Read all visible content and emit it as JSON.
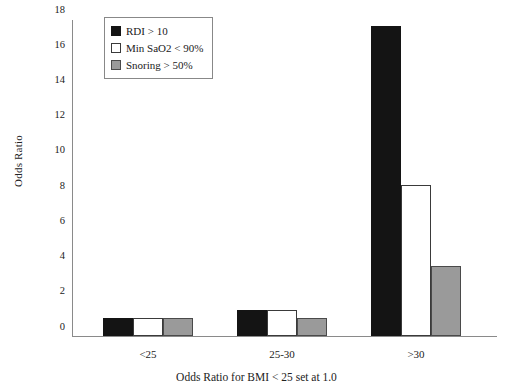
{
  "chart_data": {
    "type": "bar",
    "title": "",
    "xlabel": "Odds Ratio for BMI < 25 set at 1.0",
    "ylabel": "Odds Ratio",
    "categories": [
      "<25",
      "25-30",
      ">30"
    ],
    "series": [
      {
        "name": "RDI > 10",
        "color": "#141414",
        "values": [
          1.0,
          1.5,
          17.6
        ]
      },
      {
        "name": "Min SaO2 < 90%",
        "color": "#ffffff",
        "values": [
          1.0,
          1.5,
          8.6
        ]
      },
      {
        "name": "Snoring > 50%",
        "color": "#9a9a9a",
        "values": [
          1.0,
          1.0,
          4.0
        ]
      }
    ],
    "ylim": [
      0,
      18
    ],
    "yticks": [
      0,
      2,
      4,
      6,
      8,
      10,
      12,
      14,
      16,
      18
    ],
    "ytick_labels": [
      "0",
      "2",
      "4",
      "6",
      "8",
      "10",
      "12",
      "14",
      "16",
      "18"
    ],
    "grid": false,
    "legend_position": "upper left"
  }
}
